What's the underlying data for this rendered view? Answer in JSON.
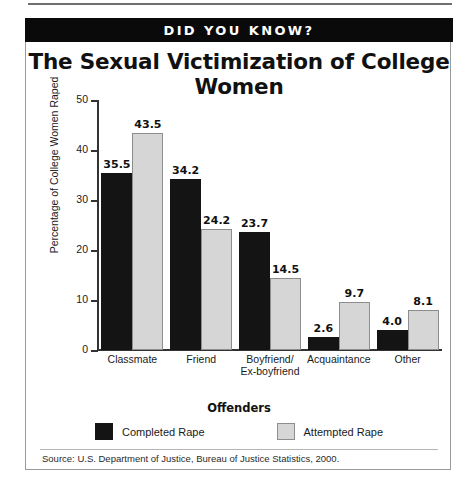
{
  "banner": {
    "text": "DID YOU KNOW?"
  },
  "source": {
    "text": "Source:  U.S. Department of Justice, Bureau of Justice Statistics, 2000."
  },
  "chart_data": {
    "type": "bar",
    "title": "The Sexual Victimization of College Women",
    "xlabel": "Offenders",
    "ylabel": "Percentage of College Women Raped",
    "categories": [
      "Classmate",
      "Friend",
      "Boyfriend/\nEx-boyfriend",
      "Acquaintance",
      "Other"
    ],
    "category_lines": [
      [
        "Classmate"
      ],
      [
        "Friend"
      ],
      [
        "Boyfriend/",
        "Ex-boyfriend"
      ],
      [
        "Acquaintance"
      ],
      [
        "Other"
      ]
    ],
    "series": [
      {
        "name": "Completed Rape",
        "color": "#141414",
        "values": [
          35.5,
          34.2,
          23.7,
          2.6,
          4.0
        ],
        "labels": [
          "35.5",
          "34.2",
          "23.7",
          "2.6",
          "4.0"
        ]
      },
      {
        "name": "Attempted Rape",
        "color": "#d6d6d6",
        "values": [
          43.5,
          24.2,
          14.5,
          9.7,
          8.1
        ],
        "labels": [
          "43.5",
          "24.2",
          "14.5",
          "9.7",
          "8.1"
        ]
      }
    ],
    "ylim": [
      0,
      50
    ],
    "yticks": [
      0,
      10,
      20,
      30,
      40,
      50
    ],
    "ytick_labels": [
      "0",
      "10",
      "20",
      "30",
      "40",
      "50"
    ],
    "grid": false,
    "legend_position": "bottom"
  }
}
